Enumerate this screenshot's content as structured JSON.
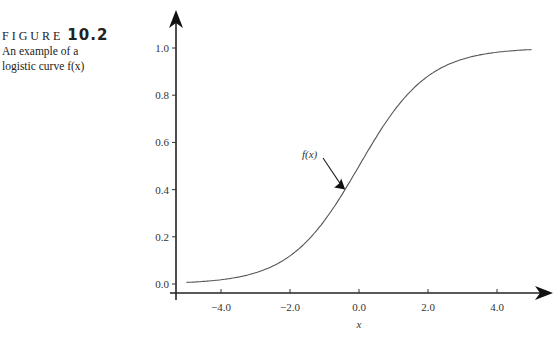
{
  "figure": {
    "label": "FIGURE",
    "number": "10.2",
    "caption_line1": "An example of a",
    "caption_line2": "logistic curve f(x)"
  },
  "chart_data": {
    "type": "line",
    "title": "An example of a logistic curve f(x)",
    "xlabel": "x",
    "ylabel": "",
    "xlim": [
      -5.0,
      5.0
    ],
    "ylim": [
      0.0,
      1.0
    ],
    "x_ticks": [
      "-4.0",
      "-2.0",
      "0.0",
      "2.0",
      "4.0"
    ],
    "y_ticks": [
      "0.0",
      "0.2",
      "0.4",
      "0.6",
      "0.8",
      "1.0"
    ],
    "grid": false,
    "legend": null,
    "annotations": [
      {
        "text": "f(x)",
        "points_to_x": -0.4,
        "points_to_y": 0.4
      }
    ],
    "series": [
      {
        "name": "f(x)",
        "function": "1/(1+exp(-x))",
        "x": [
          -5,
          -4,
          -3,
          -2,
          -1,
          0,
          1,
          2,
          3,
          4,
          5
        ],
        "y": [
          0.007,
          0.018,
          0.047,
          0.119,
          0.269,
          0.5,
          0.731,
          0.881,
          0.953,
          0.982,
          0.993
        ]
      }
    ]
  }
}
